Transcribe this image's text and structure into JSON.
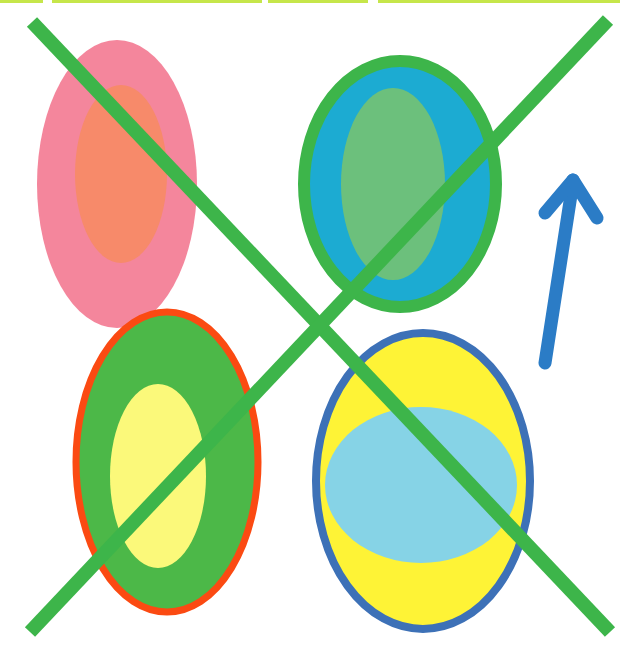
{
  "canvas": {
    "width": 620,
    "height": 653,
    "background": "#ffffff"
  },
  "top_bar": {
    "color": "#c6e64a",
    "segments": [
      {
        "x1": 0,
        "x2": 43
      },
      {
        "x1": 52,
        "x2": 262
      },
      {
        "x1": 268,
        "x2": 368
      },
      {
        "x1": 378,
        "x2": 620
      }
    ]
  },
  "shapes": [
    {
      "name": "pink-ellipse",
      "cx": 117,
      "cy": 184,
      "rx": 80,
      "ry": 144,
      "fill": "#f4869c",
      "stroke": "none",
      "stroke_width": 0
    },
    {
      "name": "orange-inner-ellipse",
      "cx": 121,
      "cy": 174,
      "rx": 46,
      "ry": 89,
      "fill": "#f78a6a",
      "stroke": "none",
      "stroke_width": 0
    },
    {
      "name": "teal-ellipse",
      "cx": 400,
      "cy": 184,
      "rx": 96,
      "ry": 123,
      "fill": "#1cabd2",
      "stroke": "#3db54a",
      "stroke_width": 12
    },
    {
      "name": "lightgreen-inner-ellipse",
      "cx": 393,
      "cy": 184,
      "rx": 52,
      "ry": 96,
      "fill": "#6cc07c",
      "stroke": "none",
      "stroke_width": 0
    },
    {
      "name": "green-ellipse",
      "cx": 167,
      "cy": 462,
      "rx": 91,
      "ry": 150,
      "fill": "#4cb848",
      "stroke": "#fb4a12",
      "stroke_width": 7
    },
    {
      "name": "yellow-inner-ellipse",
      "cx": 158,
      "cy": 476,
      "rx": 48,
      "ry": 92,
      "fill": "#fbf97a",
      "stroke": "none",
      "stroke_width": 0
    },
    {
      "name": "yellow-ellipse",
      "cx": 423,
      "cy": 481,
      "rx": 107,
      "ry": 148,
      "fill": "#fef336",
      "stroke": "#3d71b7",
      "stroke_width": 8
    },
    {
      "name": "lightblue-inner-ellipse",
      "cx": 421,
      "cy": 485,
      "rx": 96,
      "ry": 78,
      "fill": "#86d3e6",
      "stroke": "none",
      "stroke_width": 0
    }
  ],
  "cross_lines": {
    "color": "#3db54a",
    "width": 14,
    "lines": [
      {
        "name": "diagonal-line-tl-br",
        "x1": 32,
        "y1": 22,
        "x2": 610,
        "y2": 632
      },
      {
        "name": "diagonal-line-tr-bl",
        "x1": 608,
        "y1": 20,
        "x2": 30,
        "y2": 632
      }
    ]
  },
  "arrow": {
    "name": "up-arrow",
    "color": "#2b7cc6",
    "width": 13,
    "shaft": {
      "x1": 545,
      "y1": 363,
      "x2": 573,
      "y2": 182
    },
    "head_left": {
      "x1": 573,
      "y1": 180,
      "x2": 545,
      "y2": 213
    },
    "head_right": {
      "x1": 573,
      "y1": 180,
      "x2": 597,
      "y2": 218
    }
  },
  "labels": {
    "description": "Four colored ovals crossed out by a large green X, with a blue upward arrow"
  }
}
